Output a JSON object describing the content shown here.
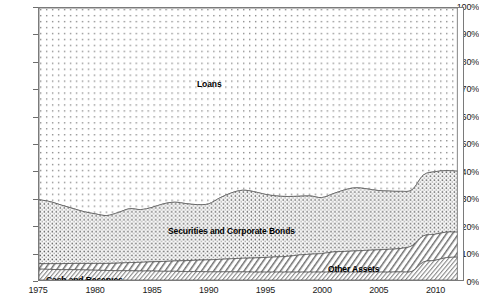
{
  "chart_data": {
    "type": "area",
    "title": "",
    "subtitle": "",
    "xlabel": "",
    "ylabel": "",
    "stacked": true,
    "stack_mode": "percent",
    "normalized_to_100": true,
    "grid": false,
    "legend_position": "inline-labels",
    "xlim": [
      1975,
      2012.5
    ],
    "ylim": [
      0,
      100
    ],
    "ytick_labels": [
      "0%",
      "10%",
      "20%",
      "30%",
      "40%",
      "50%",
      "60%",
      "70%",
      "80%",
      "90%",
      "100%"
    ],
    "ytick_values": [
      0,
      10,
      20,
      30,
      40,
      50,
      60,
      70,
      80,
      90,
      100
    ],
    "xtick_labels": [
      "1975",
      "1980",
      "1985",
      "1990",
      "1995",
      "2000",
      "2005",
      "2010"
    ],
    "xtick_values": [
      1975,
      1980,
      1985,
      1990,
      1995,
      2000,
      2005,
      2010
    ],
    "x": [
      1975,
      1976,
      1977,
      1978,
      1979,
      1980,
      1981,
      1982,
      1983,
      1984,
      1985,
      1986,
      1987,
      1988,
      1989,
      1990,
      1991,
      1992,
      1993,
      1994,
      1995,
      1996,
      1997,
      1998,
      1999,
      2000,
      2001,
      2002,
      2003,
      2004,
      2005,
      2006,
      2007,
      2008,
      2009,
      2010,
      2011,
      2012
    ],
    "series": [
      {
        "name": "Cash and Reserves",
        "pattern": "fine-diagonal-hatch",
        "color": "#e8e8e8",
        "label_x": 1976.0,
        "label_y": 1.2,
        "values": [
          4.0,
          3.9,
          3.8,
          3.8,
          3.7,
          3.6,
          3.5,
          3.4,
          3.4,
          3.3,
          3.3,
          3.2,
          3.2,
          3.1,
          3.1,
          3.0,
          3.0,
          3.0,
          3.0,
          2.9,
          2.9,
          2.9,
          2.9,
          2.9,
          2.9,
          2.9,
          2.9,
          2.9,
          2.9,
          2.9,
          2.9,
          2.9,
          3.0,
          3.2,
          6.6,
          7.2,
          8.2,
          8.4
        ]
      },
      {
        "name": "Other Assets",
        "pattern": "diagonal-hatch",
        "color": "#dedede",
        "label_x": 2003.5,
        "label_y": 7.0,
        "values": [
          2.0,
          2.1,
          2.2,
          2.3,
          2.4,
          2.5,
          2.6,
          2.8,
          3.0,
          3.2,
          3.4,
          3.6,
          3.8,
          4.0,
          4.2,
          4.4,
          4.6,
          4.8,
          5.0,
          5.2,
          5.4,
          5.6,
          5.8,
          6.3,
          6.6,
          6.8,
          7.4,
          7.6,
          7.8,
          8.0,
          8.2,
          8.4,
          8.6,
          9.4,
          9.6,
          9.6,
          9.4,
          9.2
        ]
      },
      {
        "name": "Securities and Corporate Bonds",
        "pattern": "dense-dot",
        "color": "#cfcfcf",
        "label_x": 1990.5,
        "label_y": 17.0,
        "values": [
          23.5,
          22.8,
          21.5,
          20.2,
          19.0,
          18.2,
          17.6,
          18.6,
          19.8,
          19.4,
          20.0,
          21.2,
          21.6,
          21.0,
          20.4,
          20.6,
          22.6,
          24.2,
          25.0,
          24.4,
          23.2,
          22.4,
          22.0,
          21.6,
          21.4,
          20.6,
          21.4,
          22.6,
          23.2,
          22.6,
          21.8,
          21.4,
          21.0,
          20.6,
          22.4,
          23.0,
          22.6,
          22.4
        ]
      },
      {
        "name": "Loans",
        "pattern": "sparse-dot",
        "color": "#f4f4f4",
        "label_x": 1989.0,
        "label_y": 73.0,
        "values": [
          70.5,
          71.2,
          72.5,
          73.7,
          74.9,
          75.7,
          76.3,
          75.2,
          73.8,
          74.1,
          73.3,
          72.0,
          71.4,
          71.9,
          72.3,
          72.0,
          69.8,
          68.0,
          67.0,
          67.5,
          68.5,
          69.1,
          69.3,
          69.2,
          69.1,
          69.7,
          68.3,
          66.9,
          66.1,
          66.5,
          67.1,
          67.3,
          67.4,
          66.8,
          61.4,
          60.2,
          59.8,
          60.0
        ]
      }
    ],
    "cumulative_top_boundaries": {
      "cash_top": [
        4.0,
        3.9,
        3.8,
        3.8,
        3.7,
        3.6,
        3.5,
        3.4,
        3.4,
        3.3,
        3.3,
        3.2,
        3.2,
        3.1,
        3.1,
        3.0,
        3.0,
        3.0,
        3.0,
        2.9,
        2.9,
        2.9,
        2.9,
        2.9,
        2.9,
        2.9,
        2.9,
        2.9,
        2.9,
        2.9,
        2.9,
        2.9,
        3.0,
        3.2,
        6.6,
        7.2,
        8.2,
        8.4
      ],
      "other_top": [
        6.0,
        6.0,
        6.0,
        6.1,
        6.1,
        6.1,
        6.1,
        6.2,
        6.4,
        6.5,
        6.7,
        6.8,
        7.0,
        7.1,
        7.3,
        7.4,
        7.6,
        7.8,
        8.0,
        8.1,
        8.3,
        8.5,
        8.7,
        9.2,
        9.5,
        9.7,
        10.3,
        10.5,
        10.7,
        10.9,
        11.1,
        11.3,
        11.6,
        12.6,
        16.2,
        16.8,
        17.6,
        17.6
      ],
      "securities_top": [
        29.5,
        28.8,
        27.5,
        26.3,
        25.1,
        24.3,
        23.7,
        24.8,
        26.2,
        25.9,
        26.7,
        28.0,
        28.6,
        28.1,
        27.7,
        28.0,
        30.2,
        32.0,
        33.0,
        32.5,
        31.5,
        30.9,
        30.7,
        30.8,
        30.9,
        30.3,
        31.7,
        33.1,
        33.9,
        33.5,
        33.3,
        33.7,
        32.6,
        33.2,
        38.6,
        39.8,
        40.2,
        40.0
      ]
    }
  },
  "axis": {
    "y_ticks": [
      "100%",
      "90%",
      "80%",
      "70%",
      "60%",
      "50%",
      "40%",
      "30%",
      "20%",
      "10%",
      "0%"
    ],
    "x_ticks": [
      "1975",
      "1980",
      "1985",
      "1990",
      "1995",
      "2000",
      "2005",
      "2010"
    ]
  },
  "labels": {
    "loans": "Loans",
    "securities": "Securities and Corporate Bonds",
    "other_assets": "Other Assets",
    "cash": "Cash and Reserves"
  }
}
